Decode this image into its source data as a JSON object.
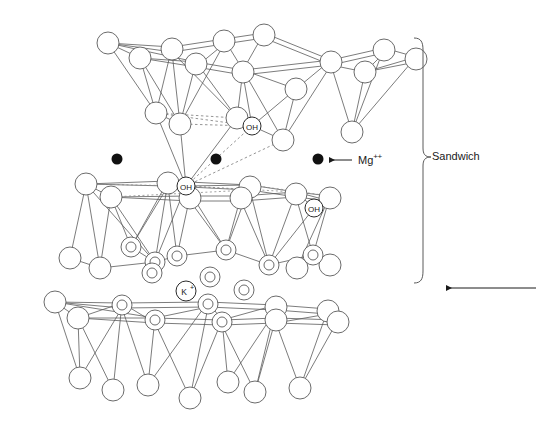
{
  "figure": {
    "kind": "crystal-structure-diagram",
    "background_color": "#ffffff",
    "line_color": "#4d4d4d",
    "text_color": "#1a1a1a",
    "dot_color": "#111111",
    "width": 536,
    "height": 434
  },
  "annotations": {
    "sandwich": {
      "text": "Sandwich",
      "x": 432,
      "y": 151
    },
    "magnesium": {
      "text": "Mg",
      "charge": "++",
      "x": 358,
      "y": 153
    },
    "hydroxyl_label": "OH",
    "potassium_label": "K",
    "potassium_charge": "+"
  },
  "legend_markers": [
    {
      "name": "mg-ion-dot",
      "label": "Mg++",
      "shape": "filled-circle",
      "color": "#111111"
    },
    {
      "name": "hydroxyl-circle",
      "label": "OH",
      "shape": "small-open-circle"
    },
    {
      "name": "potassium-circle",
      "label": "K+",
      "shape": "small-open-circle"
    },
    {
      "name": "oxygen-circle",
      "label": "",
      "shape": "open-circle"
    },
    {
      "name": "silicon-double-circle",
      "label": "",
      "shape": "double-ring-circle"
    }
  ],
  "mg_ions": [
    {
      "cx": 117,
      "cy": 159,
      "r": 5.5
    },
    {
      "cx": 216,
      "cy": 159,
      "r": 5.5
    },
    {
      "cx": 318,
      "cy": 159,
      "r": 5.5
    }
  ],
  "oh_labels": [
    {
      "cx": 252,
      "cy": 126,
      "r": 9,
      "text": "OH"
    },
    {
      "cx": 186,
      "cy": 186,
      "r": 9,
      "text": "OH"
    },
    {
      "cx": 314,
      "cy": 208,
      "r": 9,
      "text": "OH"
    }
  ],
  "k_labels": [
    {
      "cx": 186,
      "cy": 291,
      "r": 10,
      "text": "K",
      "charge": "+"
    }
  ],
  "brace": {
    "name": "sandwich-brace",
    "x": 423,
    "top": 38,
    "bottom": 283,
    "mid": 157,
    "depth": 9
  },
  "arrows": [
    {
      "name": "mg-pointer-arrow",
      "x1": 352,
      "y1": 160,
      "x2": 327,
      "y2": 160
    },
    {
      "name": "layer-pointer-arrow",
      "x1": 536,
      "y1": 288,
      "x2": 444,
      "y2": 288
    }
  ],
  "layers": [
    {
      "name": "upper-tetrahedral-sheet",
      "y_top": 30,
      "y_bottom": 140,
      "description": "inverted tetrahedra apices pointing down"
    },
    {
      "name": "octahedral-interlayer",
      "y_top": 145,
      "y_bottom": 175,
      "description": "Mg++ cation plane between sheets"
    },
    {
      "name": "middle-tetrahedral-sheet",
      "y_top": 175,
      "y_bottom": 285,
      "description": "tetrahedra apices pointing up, silicon double-ring sites"
    },
    {
      "name": "lower-tetrahedral-sheet",
      "y_top": 290,
      "y_bottom": 400,
      "description": "bottom sheet with K+ interlayer above"
    }
  ],
  "colors": {
    "line": "#4d4d4d",
    "line_light": "#8a8a8a",
    "dot": "#111111",
    "text": "#1a1a1a",
    "circle_fill": "#ffffff"
  }
}
